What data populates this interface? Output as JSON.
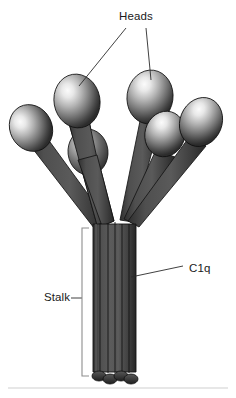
{
  "figure": {
    "background_color": "#ffffff",
    "width": 236,
    "height": 398,
    "baseline_rule_color": "#cfcfcf"
  },
  "labels": {
    "heads": "Heads",
    "stalk": "Stalk",
    "c1q": "C1q"
  },
  "label_positions": {
    "heads": {
      "x": 119,
      "y": 20
    },
    "stalk": {
      "x": 44,
      "y": 301
    },
    "c1q": {
      "x": 189,
      "y": 272
    }
  },
  "colors": {
    "text": "#1a1a1a",
    "leader_line": "#2b2b2b",
    "bracket": "#8e8e8e",
    "arm_fill_dark": "#3a3a3a",
    "arm_fill_mid": "#4c4c4c",
    "arm_outline": "#141414",
    "head_highlight": "#f2f2f2",
    "head_mid": "#9a9a9a",
    "head_shadow": "#2a2a2a",
    "stalk_fill": "#4a4a4a"
  },
  "structure": {
    "description": "Six collagen-like arms splay from a bundled stalk, each terminating in a globular head",
    "head_count": 6,
    "arm_count": 6,
    "stalk_strand_count": 6,
    "heads": [
      {
        "id": "head-1",
        "cx": 31,
        "cy": 128,
        "rx": 21,
        "ry": 24,
        "rotation": -28,
        "occluded": false
      },
      {
        "id": "head-2",
        "cx": 77,
        "cy": 101,
        "rx": 23,
        "ry": 27,
        "rotation": -10,
        "occluded": false
      },
      {
        "id": "head-3",
        "cx": 88,
        "cy": 152,
        "rx": 20,
        "ry": 23,
        "rotation": -6,
        "occluded": true
      },
      {
        "id": "head-4",
        "cx": 150,
        "cy": 97,
        "rx": 23,
        "ry": 27,
        "rotation": 8,
        "occluded": false
      },
      {
        "id": "head-5",
        "cx": 165,
        "cy": 134,
        "rx": 20,
        "ry": 23,
        "rotation": 16,
        "occluded": false
      },
      {
        "id": "head-6",
        "cx": 201,
        "cy": 122,
        "rx": 21,
        "ry": 25,
        "rotation": 22,
        "occluded": false
      }
    ],
    "stalk": {
      "top_y": 225,
      "bottom_y": 377,
      "left_x": 92,
      "right_x": 137,
      "branch_point_y": 200
    },
    "bracket": {
      "x": 82,
      "top_y": 228,
      "bottom_y": 376,
      "tick_length": 7
    },
    "baseline_rule_y": 388
  },
  "leader_lines": {
    "heads_to_head2": {
      "x1": 126,
      "y1": 28,
      "x2": 79,
      "y2": 86
    },
    "heads_to_head4": {
      "x1": 146,
      "y1": 28,
      "x2": 151,
      "y2": 80
    },
    "c1q_to_stalk": {
      "x1": 183,
      "y1": 266,
      "x2": 131,
      "y2": 277
    },
    "stalk_to_bracket": {
      "x1": 71,
      "y1": 298,
      "x2": 82,
      "y2": 298
    }
  }
}
